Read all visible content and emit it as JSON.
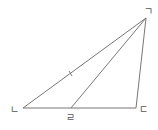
{
  "diagram": {
    "type": "triangle",
    "stroke_color": "#777777",
    "vertices": {
      "giyeok": {
        "label": "ㄱ",
        "x": 146,
        "y": 18
      },
      "nieun": {
        "label": "ㄴ",
        "x": 23,
        "y": 108
      },
      "digeut": {
        "label": "ㄷ",
        "x": 136,
        "y": 108
      },
      "rieul": {
        "label": "ㄹ",
        "x": 71,
        "y": 108
      }
    },
    "segments": [
      {
        "from": "giyeok",
        "to": "nieun"
      },
      {
        "from": "giyeok",
        "to": "digeut"
      },
      {
        "from": "nieun",
        "to": "digeut"
      },
      {
        "from": "giyeok",
        "to": "rieul"
      }
    ],
    "tick_mark": {
      "on_segment": "giyeok-nieun",
      "x": 70,
      "y": 74
    }
  }
}
